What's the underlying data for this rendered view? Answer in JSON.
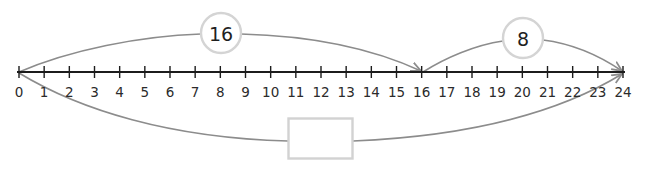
{
  "diagram": {
    "type": "number-line-jumps",
    "colors": {
      "axis": "#1c1c1c",
      "tick_label": "#2b2b2b",
      "arc": "#8c8c8c",
      "circle_stroke": "#d4d4d4",
      "box_stroke": "#d2d2d2",
      "background": "#ffffff"
    },
    "number_line": {
      "min": 0,
      "max": 24,
      "step": 1,
      "tick_labels": [
        "0",
        "1",
        "2",
        "3",
        "4",
        "5",
        "6",
        "7",
        "8",
        "9",
        "10",
        "11",
        "12",
        "13",
        "14",
        "15",
        "16",
        "17",
        "18",
        "19",
        "20",
        "21",
        "22",
        "23",
        "24"
      ]
    },
    "jumps": [
      {
        "from": 0,
        "to": 16,
        "label": "16",
        "position": "above"
      },
      {
        "from": 16,
        "to": 24,
        "label": "8",
        "position": "above"
      },
      {
        "from": 0,
        "to": 24,
        "label": "",
        "position": "below",
        "answer_box": true
      }
    ],
    "answer_box": {
      "value": "",
      "placeholder": ""
    }
  }
}
